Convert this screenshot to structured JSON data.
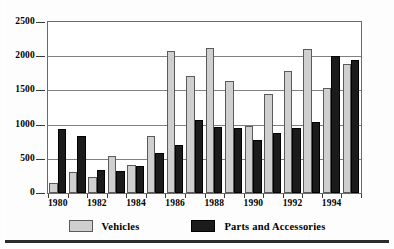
{
  "chart_data": {
    "type": "bar",
    "title": "",
    "subtitle": "",
    "xlabel": "",
    "ylabel": "",
    "ylim": [
      0,
      2500
    ],
    "yticks": [
      0,
      500,
      1000,
      1500,
      2000,
      2500
    ],
    "ytick_labels": [
      "0",
      "500",
      "1000",
      "1500",
      "2000",
      "2500"
    ],
    "grid": true,
    "legend_position": "bottom",
    "categories": [
      "1980",
      "1981",
      "1982",
      "1983",
      "1984",
      "1985",
      "1986",
      "1987",
      "1988",
      "1989",
      "1990",
      "1991",
      "1992",
      "1993",
      "1994",
      "1995"
    ],
    "xtick_labels_shown": [
      "1980",
      "1982",
      "1984",
      "1986",
      "1988",
      "1990",
      "1992",
      "1994"
    ],
    "series": [
      {
        "name": "Vehicles",
        "color": "#cfcfcf",
        "values": [
          150,
          310,
          230,
          545,
          410,
          840,
          2075,
          1715,
          2115,
          1640,
          985,
          1450,
          1780,
          2100,
          1530,
          1890
        ]
      },
      {
        "name": "Parts and Accessories",
        "color": "#1b1b1b",
        "values": [
          930,
          840,
          340,
          320,
          395,
          590,
          700,
          1070,
          965,
          955,
          775,
          880,
          950,
          1040,
          2000,
          1950
        ]
      }
    ]
  },
  "legend": {
    "entries": [
      {
        "label": "Vehicles",
        "swatch": "vehicles-swatch"
      },
      {
        "label": "Parts and Accessories",
        "swatch": "parts-and-accessories-swatch"
      }
    ]
  }
}
